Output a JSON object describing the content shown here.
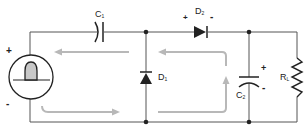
{
  "diagram": {
    "type": "circuit",
    "colors": {
      "wire": "#555555",
      "component": "#222222",
      "current_arrow": "#b8b8b8",
      "source_fill": "#c8c8c8"
    },
    "source": {
      "plus": "+",
      "minus": "-"
    },
    "components": {
      "c1": {
        "letter": "C",
        "sub": "1"
      },
      "d1": {
        "letter": "D",
        "sub": "1"
      },
      "d2": {
        "letter": "D",
        "sub": "2",
        "plus": "+",
        "minus": "-"
      },
      "c2": {
        "letter": "C",
        "sub": "2",
        "plus": "+",
        "minus": "-"
      },
      "rl": {
        "letter": "R",
        "sub": "L"
      }
    }
  }
}
